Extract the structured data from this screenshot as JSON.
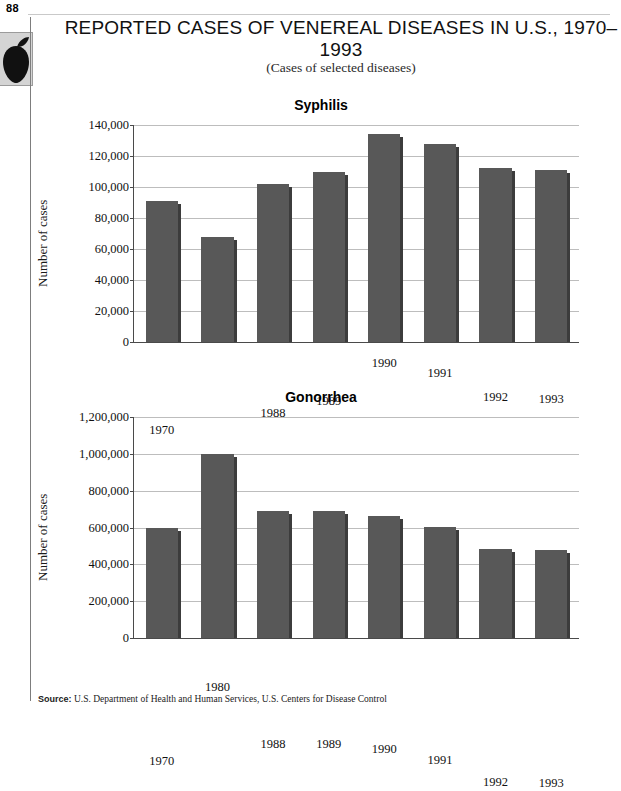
{
  "page": {
    "number": "88",
    "margin_icon": "apple-icon"
  },
  "figure": {
    "title": "REPORTED CASES OF VENEREAL DISEASES IN U.S., 1970–1993",
    "subtitle": "(Cases of selected diseases)",
    "source_label": "Source:",
    "source_text": "U.S. Department of Health and Human Services, U.S. Centers for Disease Control"
  },
  "chart_data": [
    {
      "type": "bar",
      "title": "Syphilis",
      "xlabel": "",
      "ylabel": "Number of cases",
      "categories": [
        "1970",
        "1980",
        "1988",
        "1989",
        "1990",
        "1991",
        "1992",
        "1993"
      ],
      "values": [
        91000,
        68000,
        102000,
        110000,
        134000,
        128000,
        112000,
        111000
      ],
      "ylim": [
        0,
        140000
      ],
      "yticks": [
        0,
        20000,
        40000,
        60000,
        80000,
        100000,
        120000,
        140000
      ],
      "ytick_labels": [
        "0",
        "20,000",
        "40,000",
        "60,000",
        "80,000",
        "100,000",
        "120,000",
        "140,000"
      ],
      "grid": true,
      "legend": "none",
      "bar_color": "#585858",
      "bar_side_color": "#3c3c3c"
    },
    {
      "type": "bar",
      "title": "Gonorrhea",
      "xlabel": "",
      "ylabel": "Number of cases",
      "categories": [
        "1970",
        "1980",
        "1988",
        "1989",
        "1990",
        "1991",
        "1992",
        "1993"
      ],
      "values": [
        600000,
        1000000,
        690000,
        690000,
        660000,
        605000,
        485000,
        478000
      ],
      "ylim": [
        0,
        1200000
      ],
      "yticks": [
        0,
        200000,
        400000,
        600000,
        800000,
        1000000,
        1200000
      ],
      "ytick_labels": [
        "0",
        "200,000",
        "400,000",
        "600,000",
        "800,000",
        "1,000,000",
        "1,200,000"
      ],
      "grid": true,
      "legend": "none",
      "bar_color": "#585858",
      "bar_side_color": "#3c3c3c"
    }
  ]
}
